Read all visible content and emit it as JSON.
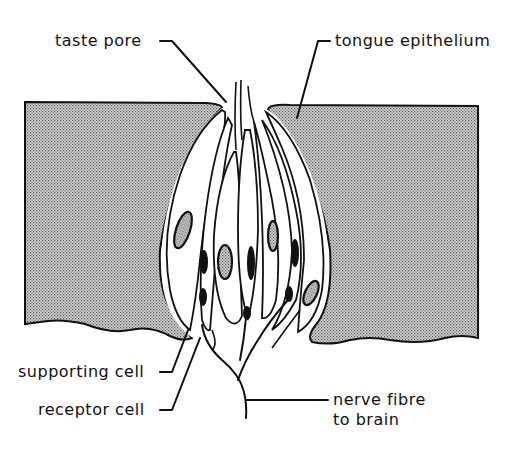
{
  "figure": {
    "colors": {
      "ink": "#111111",
      "epithelium_fill": "#b8b8b8",
      "background": "#ffffff"
    }
  },
  "labels": {
    "taste_pore": "taste pore",
    "tongue_epithelium": "tongue epithelium",
    "supporting_cell": "supporting cell",
    "receptor_cell": "receptor cell",
    "nerve_fibre_line1": "nerve fibre",
    "nerve_fibre_line2": "to brain"
  }
}
